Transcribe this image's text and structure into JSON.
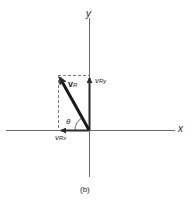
{
  "figure": {
    "caption": "(b)",
    "axes": {
      "x_label": "x",
      "y_label": "y",
      "origin": [
        89,
        130
      ]
    },
    "vectors": [
      {
        "name": "v_R",
        "label_main": "v",
        "label_sub": "R",
        "from": [
          89,
          130
        ],
        "to": [
          58,
          75
        ],
        "style": "bold-arrow"
      },
      {
        "name": "v_Ry",
        "label_main": "v",
        "label_sub": "Ry",
        "from": [
          89,
          130
        ],
        "to": [
          89,
          75
        ],
        "style": "arrow"
      },
      {
        "name": "v_Rx",
        "label_main": "v",
        "label_sub": "Rx",
        "from": [
          89,
          130
        ],
        "to": [
          58,
          130
        ],
        "style": "arrow"
      }
    ],
    "angle_label": "θ",
    "colors": {
      "ink": "#2a2a2a",
      "axis": "#6a6a6a",
      "dashed": "#7a7a7a"
    }
  }
}
